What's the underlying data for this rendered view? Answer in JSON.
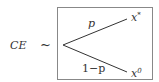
{
  "lhs": {
    "label": "CE",
    "relation": "~"
  },
  "lottery": {
    "branches": [
      {
        "prob_label": "p",
        "outcome": "x",
        "outcome_sup": "*"
      },
      {
        "prob_label": "1−p",
        "outcome": "x",
        "outcome_sup": "0"
      }
    ]
  }
}
